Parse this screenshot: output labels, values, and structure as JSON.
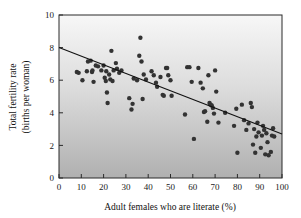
{
  "chart_data": {
    "type": "scatter",
    "title": "",
    "xlabel": "Adult females who are literate (%)",
    "ylabel_line1": "Total fertility rate",
    "ylabel_line2": "(births per woman)",
    "xlim": [
      0,
      100
    ],
    "ylim": [
      0,
      10
    ],
    "xticks": [
      0,
      10,
      20,
      30,
      40,
      50,
      60,
      70,
      80,
      90,
      100
    ],
    "yticks": [
      0,
      2,
      4,
      6,
      8,
      10
    ],
    "xtick_labels": [
      "0",
      "10",
      "20",
      "30",
      "40",
      "50",
      "60",
      "70",
      "80",
      "90",
      "100"
    ],
    "ytick_labels": [
      "0",
      "2",
      "4",
      "6",
      "8",
      "10"
    ],
    "grid": false,
    "legend": "none",
    "marker_color": "#333333",
    "plot_background": "vertical gradient light-gray to medium-gray",
    "plot_bg_top_color": "#f5f5f5",
    "plot_bg_bottom_color": "#b2b2b2",
    "frame_color": "#2a2a2a",
    "trendline": {
      "label": "linear regression",
      "color": "#111111",
      "x_start": 0,
      "y_start": 8.0,
      "x_end": 100,
      "y_end": 2.7
    },
    "points": [
      [
        8.0,
        6.5
      ],
      [
        8.8,
        6.45
      ],
      [
        10.5,
        6.0
      ],
      [
        12.5,
        6.55
      ],
      [
        13.0,
        7.15
      ],
      [
        14.2,
        7.2
      ],
      [
        14.8,
        6.5
      ],
      [
        15.0,
        6.6
      ],
      [
        15.5,
        5.9
      ],
      [
        16.5,
        6.9
      ],
      [
        17.5,
        6.85
      ],
      [
        19.0,
        6.6
      ],
      [
        20.0,
        6.9
      ],
      [
        20.5,
        6.15
      ],
      [
        21.0,
        5.95
      ],
      [
        21.2,
        6.55
      ],
      [
        21.5,
        5.25
      ],
      [
        21.8,
        4.6
      ],
      [
        22.5,
        6.35
      ],
      [
        23.0,
        6.05
      ],
      [
        23.5,
        7.8
      ],
      [
        24.0,
        5.95
      ],
      [
        24.5,
        6.6
      ],
      [
        25.5,
        7.05
      ],
      [
        26.0,
        6.7
      ],
      [
        27.0,
        6.45
      ],
      [
        28.0,
        6.6
      ],
      [
        31.5,
        4.9
      ],
      [
        32.5,
        4.2
      ],
      [
        33.0,
        4.55
      ],
      [
        33.5,
        6.1
      ],
      [
        35.0,
        6.0
      ],
      [
        36.0,
        7.5
      ],
      [
        36.5,
        8.6
      ],
      [
        37.0,
        7.15
      ],
      [
        37.5,
        4.85
      ],
      [
        38.0,
        6.35
      ],
      [
        39.0,
        6.05
      ],
      [
        41.5,
        6.55
      ],
      [
        42.5,
        6.3
      ],
      [
        43.5,
        5.85
      ],
      [
        44.0,
        5.6
      ],
      [
        45.5,
        6.2
      ],
      [
        46.5,
        5.1
      ],
      [
        47.0,
        5.05
      ],
      [
        48.0,
        6.75
      ],
      [
        48.5,
        6.75
      ],
      [
        49.0,
        6.3
      ],
      [
        50.0,
        6.0
      ],
      [
        50.5,
        5.05
      ],
      [
        56.5,
        3.9
      ],
      [
        57.5,
        6.8
      ],
      [
        58.5,
        6.8
      ],
      [
        59.5,
        5.9
      ],
      [
        60.5,
        2.4
      ],
      [
        62.5,
        6.75
      ],
      [
        63.5,
        5.85
      ],
      [
        64.5,
        5.5
      ],
      [
        65.0,
        4.05
      ],
      [
        65.5,
        4.1
      ],
      [
        66.5,
        3.45
      ],
      [
        67.0,
        6.3
      ],
      [
        67.5,
        4.6
      ],
      [
        68.0,
        4.5
      ],
      [
        68.5,
        4.45
      ],
      [
        69.0,
        4.3
      ],
      [
        69.5,
        3.95
      ],
      [
        70.0,
        6.6
      ],
      [
        70.5,
        5.3
      ],
      [
        71.5,
        3.4
      ],
      [
        74.5,
        4.0
      ],
      [
        78.5,
        3.2
      ],
      [
        79.5,
        4.25
      ],
      [
        80.0,
        1.55
      ],
      [
        82.0,
        4.5
      ],
      [
        83.0,
        3.55
      ],
      [
        84.0,
        2.95
      ],
      [
        85.0,
        3.35
      ],
      [
        86.0,
        4.6
      ],
      [
        86.5,
        4.35
      ],
      [
        87.0,
        2.05
      ],
      [
        87.5,
        3.0
      ],
      [
        88.0,
        1.55
      ],
      [
        88.5,
        2.55
      ],
      [
        89.0,
        3.4
      ],
      [
        89.5,
        2.8
      ],
      [
        90.5,
        1.85
      ],
      [
        91.0,
        2.6
      ],
      [
        91.5,
        3.2
      ],
      [
        92.0,
        2.95
      ],
      [
        92.5,
        1.45
      ],
      [
        93.0,
        2.75
      ],
      [
        93.5,
        2.2
      ],
      [
        94.0,
        1.4
      ],
      [
        95.0,
        1.6
      ],
      [
        95.5,
        2.6
      ],
      [
        96.0,
        3.05
      ],
      [
        96.5,
        2.55
      ]
    ]
  }
}
